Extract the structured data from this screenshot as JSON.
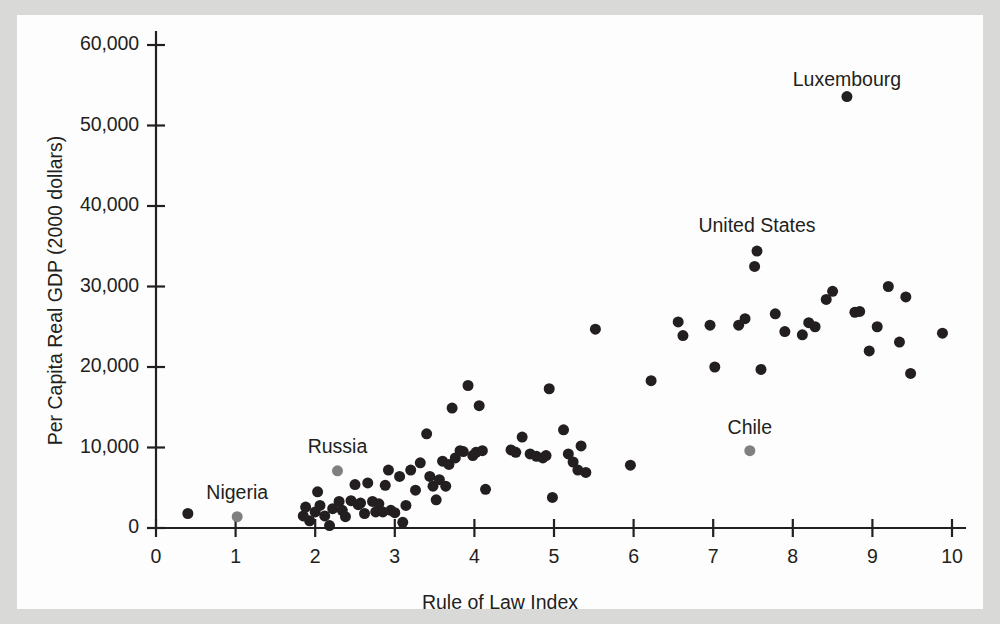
{
  "figure": {
    "background_color": "#d9d9d7",
    "panel_color": "#fdfdfd",
    "axis_color": "#231f20"
  },
  "chart_data": {
    "type": "scatter",
    "title": "",
    "xlabel": "Rule of Law Index",
    "ylabel": "Per Capita Real GDP (2000 dollars)",
    "xlim": [
      0,
      10
    ],
    "ylim": [
      0,
      60000
    ],
    "xticks": [
      0,
      1,
      2,
      3,
      4,
      5,
      6,
      7,
      8,
      9,
      10
    ],
    "xticklabels": [
      "0",
      "1",
      "2",
      "3",
      "4",
      "5",
      "6",
      "7",
      "8",
      "9",
      "10"
    ],
    "yticks": [
      0,
      10000,
      20000,
      30000,
      40000,
      50000,
      60000
    ],
    "yticklabels": [
      "0",
      "10,000",
      "20,000",
      "30,000",
      "40,000",
      "50,000",
      "60,000"
    ],
    "grid": false,
    "legend": null,
    "marker_color": "#231f20",
    "highlight_marker_color": "#808080",
    "marker_size_px": 11,
    "annotations": [
      {
        "text": "Luxembourg",
        "x": 8.68,
        "y": 55500,
        "point_x": 8.68,
        "point_y": 53600
      },
      {
        "text": "United States",
        "x": 7.55,
        "y": 37400,
        "point_x": 7.55,
        "point_y": 34400
      },
      {
        "text": "Chile",
        "x": 7.46,
        "y": 12300,
        "point_x": 7.46,
        "point_y": 9600
      },
      {
        "text": "Russia",
        "x": 2.28,
        "y": 9900,
        "point_x": 2.28,
        "point_y": 7100
      },
      {
        "text": "Nigeria",
        "x": 1.02,
        "y": 4200,
        "point_x": 1.02,
        "point_y": 1400
      }
    ],
    "series": [
      {
        "name": "Countries",
        "color": "#231f20",
        "points": [
          [
            0.4,
            1800
          ],
          [
            1.85,
            1500
          ],
          [
            1.88,
            2600
          ],
          [
            1.93,
            900
          ],
          [
            2.0,
            2000
          ],
          [
            2.03,
            4500
          ],
          [
            2.06,
            2800
          ],
          [
            2.12,
            1500
          ],
          [
            2.18,
            300
          ],
          [
            2.22,
            2400
          ],
          [
            2.3,
            3300
          ],
          [
            2.34,
            2200
          ],
          [
            2.38,
            1400
          ],
          [
            2.45,
            3400
          ],
          [
            2.5,
            5400
          ],
          [
            2.54,
            2900
          ],
          [
            2.57,
            3100
          ],
          [
            2.62,
            1800
          ],
          [
            2.66,
            5600
          ],
          [
            2.72,
            3300
          ],
          [
            2.76,
            2000
          ],
          [
            2.8,
            3000
          ],
          [
            2.85,
            2000
          ],
          [
            2.88,
            5300
          ],
          [
            2.92,
            7200
          ],
          [
            2.95,
            2200
          ],
          [
            3.0,
            1900
          ],
          [
            3.06,
            6400
          ],
          [
            3.1,
            700
          ],
          [
            3.14,
            2800
          ],
          [
            3.2,
            7200
          ],
          [
            3.26,
            4700
          ],
          [
            3.32,
            8100
          ],
          [
            3.4,
            11700
          ],
          [
            3.44,
            6400
          ],
          [
            3.48,
            5200
          ],
          [
            3.52,
            3500
          ],
          [
            3.56,
            6000
          ],
          [
            3.6,
            8300
          ],
          [
            3.64,
            5200
          ],
          [
            3.68,
            7900
          ],
          [
            3.72,
            14900
          ],
          [
            3.76,
            8700
          ],
          [
            3.82,
            9600
          ],
          [
            3.86,
            9500
          ],
          [
            3.92,
            17700
          ],
          [
            3.98,
            9000
          ],
          [
            4.02,
            9400
          ],
          [
            4.06,
            15200
          ],
          [
            4.1,
            9600
          ],
          [
            4.14,
            4800
          ],
          [
            4.46,
            9700
          ],
          [
            4.52,
            9400
          ],
          [
            4.6,
            11300
          ],
          [
            4.7,
            9200
          ],
          [
            4.78,
            8900
          ],
          [
            4.86,
            8700
          ],
          [
            4.9,
            9000
          ],
          [
            4.94,
            17300
          ],
          [
            4.98,
            3800
          ],
          [
            5.12,
            12200
          ],
          [
            5.18,
            9200
          ],
          [
            5.24,
            8200
          ],
          [
            5.3,
            7200
          ],
          [
            5.34,
            10200
          ],
          [
            5.4,
            6900
          ],
          [
            5.52,
            24700
          ],
          [
            5.96,
            7800
          ],
          [
            6.22,
            18300
          ],
          [
            6.56,
            25600
          ],
          [
            6.62,
            23900
          ],
          [
            6.96,
            25200
          ],
          [
            7.02,
            20000
          ],
          [
            7.32,
            25200
          ],
          [
            7.4,
            26000
          ],
          [
            7.52,
            32500
          ],
          [
            7.55,
            34400
          ],
          [
            7.6,
            19700
          ],
          [
            7.78,
            26600
          ],
          [
            7.9,
            24400
          ],
          [
            8.12,
            24000
          ],
          [
            8.2,
            25500
          ],
          [
            8.28,
            25000
          ],
          [
            8.42,
            28400
          ],
          [
            8.5,
            29400
          ],
          [
            8.68,
            53600
          ],
          [
            8.78,
            26800
          ],
          [
            8.84,
            26900
          ],
          [
            8.96,
            22000
          ],
          [
            9.06,
            25000
          ],
          [
            9.2,
            30000
          ],
          [
            9.34,
            23100
          ],
          [
            9.42,
            28700
          ],
          [
            9.48,
            19200
          ],
          [
            9.88,
            24200
          ]
        ]
      },
      {
        "name": "Highlighted",
        "color": "#808080",
        "points": [
          [
            1.02,
            1400
          ],
          [
            2.28,
            7100
          ],
          [
            7.46,
            9600
          ]
        ]
      }
    ]
  }
}
